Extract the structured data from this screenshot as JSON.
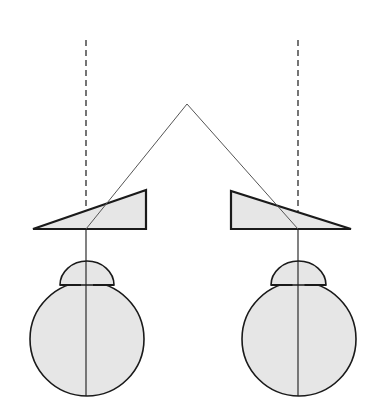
{
  "diagram": {
    "title": "",
    "colors": {
      "background": "#ffffff",
      "stroke": "#1a1a1a",
      "fill": "#e6e6e6",
      "ray": "#555555"
    },
    "fixation_point": {
      "x": 187,
      "y": 104
    },
    "left": {
      "visual_axis_dashed": {
        "x": 86,
        "y1": 40,
        "y2": 229
      },
      "prism": {
        "points": "33,229 146,190 146,229"
      },
      "eye": {
        "cx": 87,
        "cy": 339,
        "rx": 57,
        "ry": 57,
        "cornea_x1": 60,
        "cornea_x2": 114,
        "cornea_top": 261,
        "iris_y": 285
      },
      "optical_axis": {
        "x": 86,
        "y1": 229,
        "y2": 396
      }
    },
    "right": {
      "visual_axis_dashed": {
        "x": 298,
        "y1": 40,
        "y2": 229
      },
      "prism": {
        "points": "231,191 231,229 351,229"
      },
      "eye": {
        "cx": 299,
        "cy": 339,
        "rx": 57,
        "ry": 57,
        "cornea_x1": 271,
        "cornea_x2": 326,
        "cornea_top": 261,
        "iris_y": 285
      },
      "optical_axis": {
        "x": 298,
        "y1": 229,
        "y2": 396
      }
    }
  }
}
